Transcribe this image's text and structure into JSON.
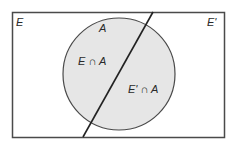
{
  "diagram": {
    "type": "venn",
    "colors": {
      "background": "#ffffff",
      "stroke": "#3a3a3a",
      "circle_fill": "#e6e6e6",
      "text": "#2a2a2a"
    },
    "labels": {
      "region_e": "E",
      "region_e_prime": "E'",
      "set_a": "A",
      "intersection_e_a": "E ∩ A",
      "intersection_e_prime_a": "E' ∩ A"
    }
  }
}
